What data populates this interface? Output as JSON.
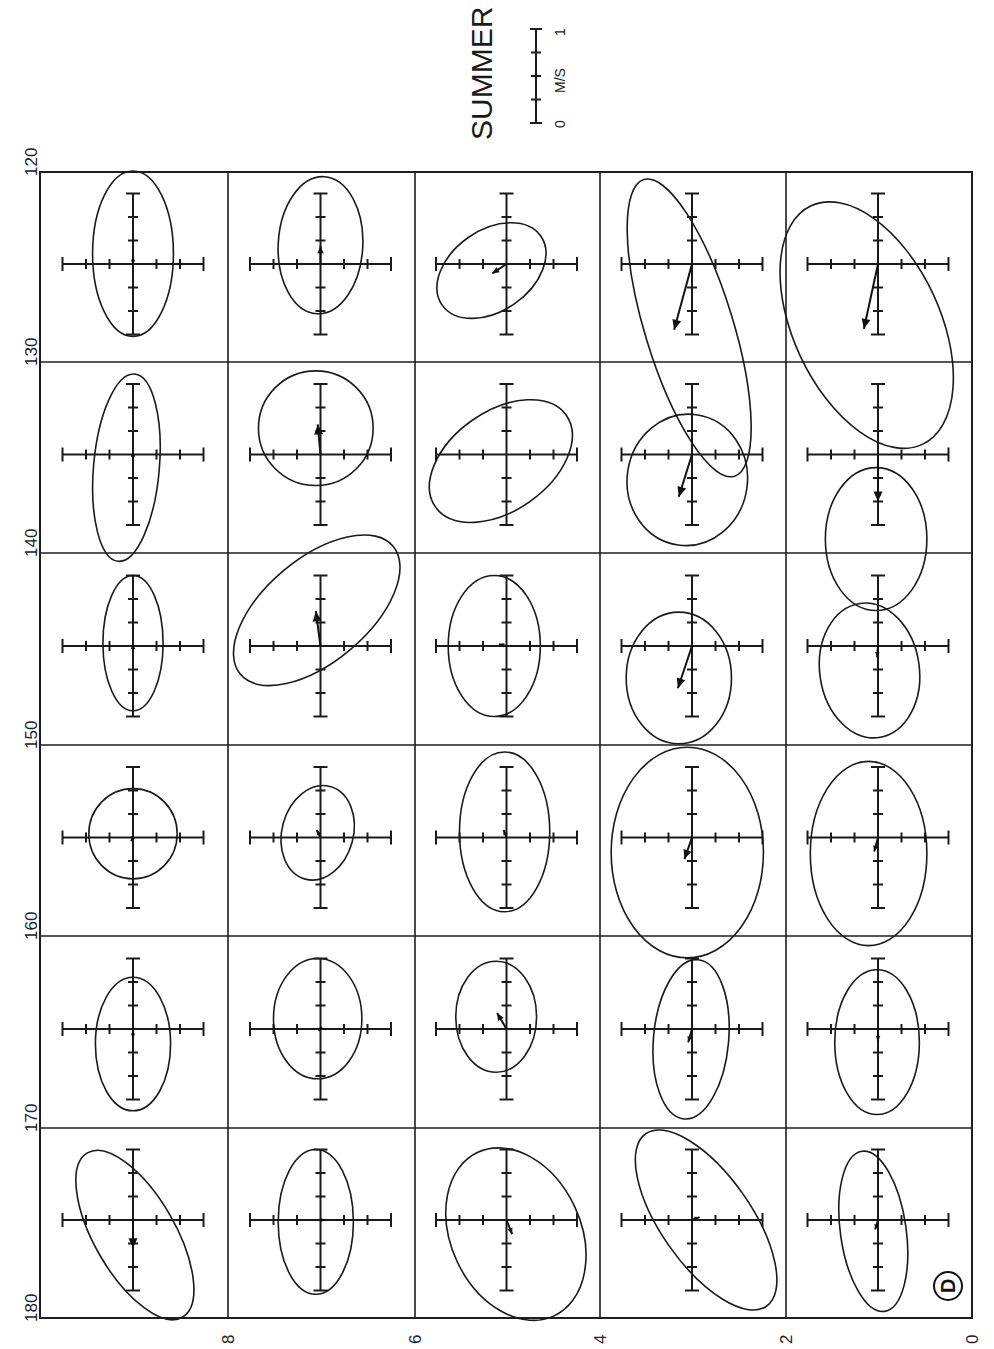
{
  "chart_data": {
    "type": "scatter",
    "subtype": "current-variance-ellipses",
    "title": "SUMMER",
    "panel_label": "D",
    "orientation": "rotated 90° counter-clockwise (longitude along left edge, latitude along bottom edge)",
    "scale_bar": {
      "label": "M/S",
      "min_label": "0",
      "max_label": "1",
      "min": 0,
      "max": 1,
      "ticks": [
        0,
        0.25,
        0.5,
        0.75,
        1
      ]
    },
    "crosshair": {
      "tick_interval_ms": 0.25,
      "ticks_per_arm": 3
    },
    "longitude_axis": {
      "side": "left",
      "ticks": [
        "120",
        "130",
        "140",
        "150",
        "160",
        "170",
        "180"
      ]
    },
    "latitude_axis": {
      "side": "bottom",
      "ticks": [
        "8",
        "6",
        "4",
        "2",
        "0"
      ]
    },
    "grid": {
      "rows": 6,
      "cols": 5
    },
    "cells_note": "row i = longitude band (120-130 ... 170-180), col j = latitude band (10-8 ... 2-0); ellipse & vector components in m/s in the screen frame (x right, y down), rot in degrees clockwise",
    "cells": [
      [
        {
          "ex": 0.0,
          "ey": -0.11,
          "a": 0.43,
          "b": 0.88,
          "rot": 0,
          "vx": 0.0,
          "vy": -0.08
        },
        {
          "ex": 0.0,
          "ey": -0.2,
          "a": 0.45,
          "b": 0.73,
          "rot": 3,
          "vx": 0.0,
          "vy": -0.19
        },
        {
          "ex": -0.16,
          "ey": 0.07,
          "a": 0.64,
          "b": 0.43,
          "rot": -35,
          "vx": -0.15,
          "vy": 0.1
        },
        {
          "ex": -0.03,
          "ey": 0.68,
          "a": 0.47,
          "b": 1.65,
          "rot": -17,
          "vx": -0.19,
          "vy": 0.7
        },
        {
          "ex": -0.12,
          "ey": 0.65,
          "a": 0.78,
          "b": 1.4,
          "rot": -25,
          "vx": -0.15,
          "vy": 0.69
        }
      ],
      [
        {
          "ex": -0.07,
          "ey": 0.14,
          "a": 0.35,
          "b": 1.0,
          "rot": 5,
          "vx": 0.0,
          "vy": -0.03
        },
        {
          "ex": -0.05,
          "ey": -0.28,
          "a": 0.61,
          "b": 0.61,
          "rot": 0,
          "vx": -0.03,
          "vy": -0.32
        },
        {
          "ex": -0.06,
          "ey": 0.07,
          "a": 0.85,
          "b": 0.53,
          "rot": -35,
          "vx": 0.0,
          "vy": 0.0
        },
        {
          "ex": -0.05,
          "ey": 0.27,
          "a": 0.64,
          "b": 0.7,
          "rot": 8,
          "vx": -0.14,
          "vy": 0.45
        },
        {
          "ex": -0.02,
          "ey": 0.9,
          "a": 0.54,
          "b": 0.76,
          "rot": 0,
          "vx": 0.0,
          "vy": 0.5
        }
      ],
      [
        {
          "ex": 0.0,
          "ey": -0.03,
          "a": 0.32,
          "b": 0.72,
          "rot": 0,
          "vx": 0.0,
          "vy": -0.02
        },
        {
          "ex": -0.04,
          "ey": -0.38,
          "a": 1.06,
          "b": 0.55,
          "rot": -40,
          "vx": -0.05,
          "vy": -0.37
        },
        {
          "ex": -0.13,
          "ey": 0.0,
          "a": 0.49,
          "b": 0.75,
          "rot": 0,
          "vx": -0.08,
          "vy": -0.02
        },
        {
          "ex": -0.14,
          "ey": 0.34,
          "a": 0.56,
          "b": 0.7,
          "rot": 0,
          "vx": -0.15,
          "vy": 0.45
        },
        {
          "ex": -0.09,
          "ey": 0.26,
          "a": 0.53,
          "b": 0.72,
          "rot": -8,
          "vx": -0.01,
          "vy": 0.12
        }
      ],
      [
        {
          "ex": 0.0,
          "ey": -0.04,
          "a": 0.47,
          "b": 0.48,
          "rot": 0,
          "vx": -0.02,
          "vy": 0.04
        },
        {
          "ex": -0.03,
          "ey": -0.05,
          "a": 0.38,
          "b": 0.51,
          "rot": 15,
          "vx": -0.04,
          "vy": -0.08
        },
        {
          "ex": -0.02,
          "ey": -0.06,
          "a": 0.48,
          "b": 0.85,
          "rot": 0,
          "vx": -0.03,
          "vy": -0.08
        },
        {
          "ex": -0.05,
          "ey": 0.16,
          "a": 0.81,
          "b": 1.12,
          "rot": 0,
          "vx": -0.08,
          "vy": 0.23
        },
        {
          "ex": -0.1,
          "ey": 0.17,
          "a": 0.62,
          "b": 0.98,
          "rot": 0,
          "vx": -0.04,
          "vy": 0.15
        }
      ],
      [
        {
          "ex": 0.0,
          "ey": 0.16,
          "a": 0.4,
          "b": 0.71,
          "rot": 0,
          "vx": 0.0,
          "vy": 0.1
        },
        {
          "ex": -0.03,
          "ey": -0.11,
          "a": 0.47,
          "b": 0.64,
          "rot": 0,
          "vx": -0.02,
          "vy": 0.02
        },
        {
          "ex": -0.11,
          "ey": -0.13,
          "a": 0.43,
          "b": 0.59,
          "rot": 0,
          "vx": -0.1,
          "vy": -0.17
        },
        {
          "ex": -0.01,
          "ey": 0.11,
          "a": 0.4,
          "b": 0.85,
          "rot": 5,
          "vx": -0.04,
          "vy": 0.14
        },
        {
          "ex": -0.01,
          "ey": 0.14,
          "a": 0.45,
          "b": 0.77,
          "rot": 0,
          "vx": 0.0,
          "vy": 0.13
        }
      ],
      [
        {
          "ex": 0.02,
          "ey": 0.16,
          "a": 1.01,
          "b": 0.43,
          "rot": 60,
          "vx": 0.0,
          "vy": 0.3
        },
        {
          "ex": -0.05,
          "ey": 0.02,
          "a": 0.4,
          "b": 0.77,
          "rot": 0,
          "vx": 0.05,
          "vy": 0.0
        },
        {
          "ex": 0.1,
          "ey": 0.15,
          "a": 0.69,
          "b": 0.96,
          "rot": -25,
          "vx": 0.06,
          "vy": 0.15
        },
        {
          "ex": 0.15,
          "ey": 0.0,
          "a": 1.12,
          "b": 0.48,
          "rot": 55,
          "vx": 0.08,
          "vy": -0.03
        },
        {
          "ex": -0.05,
          "ey": 0.12,
          "a": 0.35,
          "b": 0.86,
          "rot": -8,
          "vx": -0.03,
          "vy": 0.1
        }
      ]
    ]
  }
}
